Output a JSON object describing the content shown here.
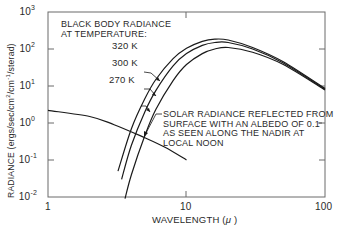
{
  "chart_data": {
    "type": "line",
    "title": "",
    "xlabel": "WAVELENGTH (μ)",
    "ylabel": "RADIANCE (ergs/sec/cm²/cm⁻¹/sterad)",
    "xscale": "log",
    "yscale": "log",
    "xlim": [
      1,
      100
    ],
    "ylim": [
      0.01,
      1000
    ],
    "grid": false,
    "x_ticks": [
      "1",
      "10",
      "100"
    ],
    "y_ticks": [
      {
        "base": "10",
        "exp": "3"
      },
      {
        "base": "10",
        "exp": "2"
      },
      {
        "base": "10",
        "exp": "1"
      },
      {
        "base": "10",
        "exp": "0"
      },
      {
        "base": "10",
        "exp": "-1"
      },
      {
        "base": "10",
        "exp": "-2"
      }
    ],
    "series": [
      {
        "name": "320 K",
        "x": [
          3.2,
          4,
          5,
          6,
          8,
          10,
          13,
          16,
          20,
          30,
          50,
          100
        ],
        "values": [
          0.05,
          0.7,
          4.5,
          15,
          55,
          105,
          160,
          185,
          175,
          110,
          45,
          8.5
        ]
      },
      {
        "name": "300 K",
        "x": [
          3.4,
          4,
          5,
          6,
          8,
          10,
          13,
          16,
          20,
          30,
          50,
          100
        ],
        "values": [
          0.03,
          0.25,
          2.0,
          7.5,
          35,
          75,
          125,
          150,
          150,
          100,
          42,
          8.2
        ]
      },
      {
        "name": "270 K",
        "x": [
          3.6,
          4,
          5,
          6,
          8,
          10,
          13,
          16,
          20,
          30,
          50,
          100
        ],
        "values": [
          0.009,
          0.04,
          0.45,
          2.3,
          14,
          38,
          75,
          100,
          110,
          82,
          38,
          7.8
        ]
      },
      {
        "name": "Solar radiance reflected (albedo 0.1)",
        "x": [
          1,
          2,
          3,
          5,
          7,
          10
        ],
        "values": [
          2.2,
          1.5,
          0.9,
          0.4,
          0.22,
          0.1
        ]
      }
    ],
    "annotations": {
      "blackbody_title_line1": "BLACK BODY RADIANCE",
      "blackbody_title_line2": "AT TEMPERATURE:",
      "temp_labels": [
        "320 K",
        "300 K",
        "270 K"
      ],
      "solar_note": [
        "SOLAR RADIANCE REFLECTED FROM",
        "SURFACE WITH AN ALBEDO OF 0.1",
        "AS SEEN ALONG THE NADIR AT",
        "LOCAL NOON"
      ]
    },
    "legend": "none (inline annotations)"
  },
  "labels": {
    "xlabel_text": "WAVELENGTH (",
    "xlabel_mu": "μ",
    "xlabel_close": ")",
    "ylabel_pre": "RADIANCE (ergs/sec/cm",
    "ylabel_sq": "2",
    "ylabel_mid": "/cm",
    "ylabel_inv": "-1",
    "ylabel_post": "/sterad)"
  },
  "style": {
    "line_color": "#1a1a1a",
    "axis_color": "#555555",
    "background": "#ffffff"
  }
}
